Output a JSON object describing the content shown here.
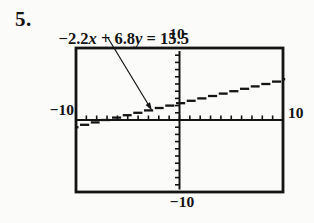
{
  "problem": {
    "number": "5.",
    "equation": {
      "lead": "−2.2",
      "var_x": "x",
      "middle": " + 6.8",
      "var_y": "y",
      "tail": " = 15.5",
      "full_text": "−2.2x + 6.8y = 15.5"
    }
  },
  "chart_data": {
    "type": "line",
    "title": "",
    "equation_text": "−2.2x + 6.8y = 15.5",
    "coefficients": {
      "a": -2.2,
      "b": 6.8,
      "c": 15.5
    },
    "slope": 0.3235,
    "y_intercept": 2.2794,
    "x_intercept": -7.0455,
    "window": {
      "xmin": -10,
      "xmax": 10,
      "ymin": -10,
      "ymax": 10,
      "xscl": 1,
      "yscl": 1
    },
    "axis_tick_labels": {
      "top": "10",
      "bottom": "−10",
      "left": "−10",
      "right": "10"
    },
    "series": [
      {
        "name": "−2.2x + 6.8y = 15.5",
        "x": [
          -10,
          10
        ],
        "y": [
          -0.9559,
          5.5147
        ]
      }
    ],
    "grid": false,
    "legend": "none",
    "render_style": "calculator stair-step pixels",
    "annotation": {
      "type": "leader-arrow",
      "from": "equation",
      "to": "graphed-line"
    }
  },
  "colors": {
    "ink": "#141414",
    "background": "#fbfbfa"
  }
}
